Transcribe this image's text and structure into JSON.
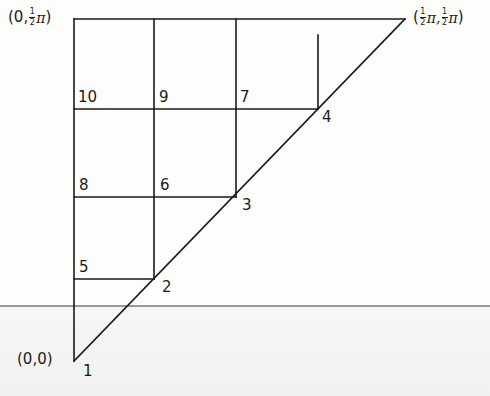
{
  "diagram": {
    "type": "grid-triangle",
    "corner_labels": {
      "origin": "(0,0)",
      "top_left": {
        "open": "(0,",
        "frac_num": "1",
        "frac_den": "2",
        "pi": "π",
        "close": ")"
      },
      "top_right": {
        "open": "(",
        "frac1_num": "1",
        "frac1_den": "2",
        "pi1": "π,",
        "frac2_num": "1",
        "frac2_den": "2",
        "pi2": "π",
        "close": ")"
      }
    },
    "node_labels": {
      "n1": "1",
      "n2": "2",
      "n3": "3",
      "n4": "4",
      "n5": "5",
      "n6": "6",
      "n7": "7",
      "n8": "8",
      "n9": "9",
      "n10": "10"
    },
    "colors": {
      "ink": "#1a1a1a",
      "rule": "#9a9a9a",
      "paper": "#fdfdfc"
    }
  }
}
